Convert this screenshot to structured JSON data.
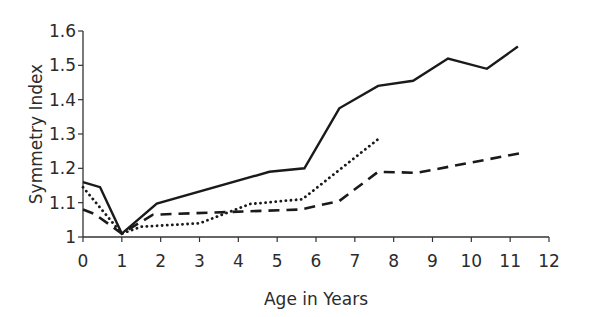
{
  "chart_data": {
    "type": "line",
    "title": "",
    "xlabel": "Age in Years",
    "ylabel": "Symmetry Index",
    "xlim": [
      0,
      12
    ],
    "ylim": [
      1,
      1.6
    ],
    "x_ticks": [
      "0",
      "1",
      "2",
      "3",
      "4",
      "5",
      "6",
      "7",
      "8",
      "9",
      "10",
      "11",
      "12"
    ],
    "y_ticks": [
      "1",
      "1.1",
      "1.2",
      "1.3",
      "1.4",
      "1.5",
      "1.6"
    ],
    "grid": false,
    "legend": null,
    "series": [
      {
        "name": "solid",
        "style": "solid",
        "color": "#1a1a1a",
        "x": [
          0,
          0.44,
          1.0,
          1.9,
          4.8,
          5.7,
          6.6,
          7.6,
          8.5,
          9.4,
          10.4,
          11.2
        ],
        "y": [
          1.16,
          1.145,
          1.01,
          1.097,
          1.19,
          1.2,
          1.375,
          1.44,
          1.455,
          1.52,
          1.49,
          1.555
        ]
      },
      {
        "name": "dashed",
        "style": "dashed",
        "color": "#1a1a1a",
        "x": [
          0,
          0.3,
          1.0,
          1.8,
          5.6,
          6.6,
          7.6,
          8.6,
          11.3
        ],
        "y": [
          1.08,
          1.067,
          1.01,
          1.065,
          1.08,
          1.105,
          1.19,
          1.187,
          1.245
        ]
      },
      {
        "name": "dotted",
        "style": "dotted",
        "color": "#1a1a1a",
        "x": [
          0,
          1.0,
          1.5,
          3.0,
          4.3,
          5.65,
          7.6
        ],
        "y": [
          1.145,
          1.01,
          1.03,
          1.04,
          1.096,
          1.11,
          1.285
        ]
      }
    ]
  }
}
